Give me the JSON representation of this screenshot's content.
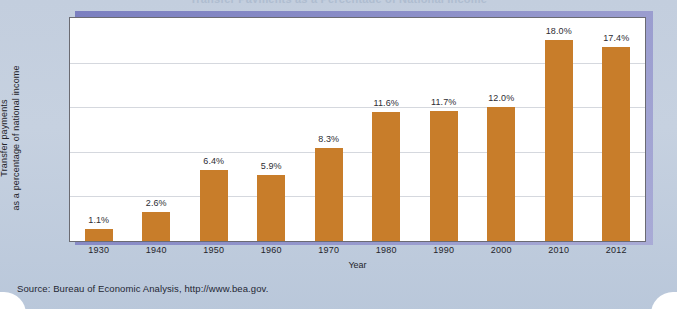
{
  "figure": {
    "title": "Transfer Payments as a Percentage of National Income",
    "source_note": "Source: Bureau of Economic Analysis, http://www.bea.gov.",
    "panel_color": "#c3cede",
    "frame_shadow_color": "#8d90c9",
    "plot_background": "#ffffff",
    "bar_color": "#c87d2a",
    "gridline_color": "#d5d8de"
  },
  "chart_data": {
    "type": "bar",
    "title": "Transfer Payments as a Percentage of National Income",
    "xlabel": "Year",
    "ylabel": "Transfer payments as a percentage of national income",
    "ylabel_line1": "Transfer payments",
    "ylabel_line2": "as a percentage of national income",
    "categories": [
      "1930",
      "1940",
      "1950",
      "1960",
      "1970",
      "1980",
      "1990",
      "2000",
      "2010",
      "2012"
    ],
    "values": [
      1.1,
      2.6,
      6.4,
      5.9,
      8.3,
      11.6,
      11.7,
      12.0,
      18.0,
      17.4
    ],
    "data_labels": [
      "1.1%",
      "2.6%",
      "6.4%",
      "5.9%",
      "8.3%",
      "11.6%",
      "11.7%",
      "12.0%",
      "18.0%",
      "17.4%"
    ],
    "ylim": [
      0,
      20
    ],
    "yticks": [
      0,
      5,
      10,
      15,
      20
    ],
    "gridlines": [
      4,
      8,
      12,
      16
    ],
    "grid": true,
    "legend": "none",
    "series_name": "Transfer payments as a percentage of national income",
    "units": "percent"
  }
}
